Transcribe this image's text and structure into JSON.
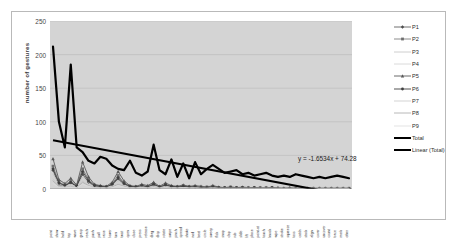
{
  "chart_data": {
    "type": "line",
    "title": "",
    "xlabel": "",
    "ylabel": "number of gestures",
    "ylim": [
      0,
      250
    ],
    "yticks": [
      0,
      50,
      100,
      150,
      200,
      250
    ],
    "grid": true,
    "legend_position": "right",
    "trendline": {
      "name": "Linear (Total)",
      "equation": "y = -1.6534x + 74.28",
      "slope": -1.6534,
      "intercept": 74.28
    },
    "categories": [
      "point",
      "show",
      "hold",
      "tap",
      "wave",
      "grasp",
      "reach",
      "push",
      "pull",
      "raise",
      "lower",
      "turn",
      "twist",
      "open",
      "close",
      "press",
      "release",
      "drag",
      "drop",
      "rotate",
      "swipe",
      "pinch",
      "spread",
      "shake",
      "nod",
      "beat",
      "circle",
      "sweep",
      "flick",
      "snap",
      "clap",
      "rub",
      "slide",
      "lift",
      "place",
      "point-at",
      "touch",
      "knock",
      "wipe",
      "stroke",
      "squeeze",
      "toss",
      "catch",
      "stack",
      "align",
      "cover",
      "uncover",
      "count",
      "trace",
      "mark",
      "other"
    ],
    "series": [
      {
        "name": "P1",
        "color": "#4d4d4d",
        "values": [
          28,
          6,
          5,
          9,
          4,
          22,
          10,
          4,
          3,
          2,
          6,
          15,
          7,
          3,
          2,
          4,
          3,
          6,
          2,
          5,
          3,
          2,
          4,
          2,
          3,
          2,
          2,
          3,
          2,
          1,
          2,
          1,
          2,
          1,
          2,
          1,
          1,
          2,
          1,
          1,
          1,
          1,
          1,
          1,
          1,
          1,
          1,
          1,
          1,
          1,
          1
        ]
      },
      {
        "name": "P2",
        "color": "#6e6e6e",
        "values": [
          34,
          10,
          6,
          12,
          5,
          30,
          14,
          6,
          4,
          3,
          8,
          20,
          9,
          4,
          3,
          5,
          4,
          8,
          3,
          7,
          4,
          3,
          5,
          3,
          4,
          3,
          3,
          4,
          2,
          2,
          3,
          2,
          2,
          2,
          2,
          2,
          2,
          2,
          1,
          1,
          1,
          1,
          1,
          1,
          1,
          1,
          1,
          1,
          1,
          1,
          1
        ]
      },
      {
        "name": "P3",
        "color": "#c2c2c2",
        "values": [
          22,
          8,
          4,
          7,
          3,
          18,
          9,
          3,
          3,
          2,
          5,
          12,
          6,
          3,
          2,
          3,
          2,
          5,
          2,
          4,
          3,
          2,
          3,
          2,
          2,
          2,
          2,
          2,
          1,
          1,
          2,
          1,
          1,
          1,
          1,
          1,
          1,
          1,
          1,
          1,
          1,
          1,
          1,
          1,
          1,
          1,
          1,
          1,
          1,
          1,
          1
        ]
      },
      {
        "name": "P4",
        "color": "#d0d0d0",
        "values": [
          18,
          5,
          3,
          6,
          3,
          14,
          7,
          3,
          2,
          2,
          4,
          10,
          5,
          2,
          2,
          3,
          2,
          4,
          2,
          3,
          2,
          2,
          3,
          2,
          2,
          1,
          1,
          2,
          1,
          1,
          1,
          1,
          1,
          1,
          1,
          1,
          1,
          1,
          1,
          1,
          1,
          1,
          1,
          1,
          1,
          1,
          1,
          1,
          1,
          1,
          1
        ]
      },
      {
        "name": "P5",
        "color": "#5a5a5a",
        "values": [
          45,
          14,
          8,
          16,
          6,
          40,
          18,
          7,
          5,
          4,
          10,
          26,
          12,
          5,
          4,
          7,
          5,
          10,
          4,
          9,
          5,
          4,
          6,
          4,
          5,
          4,
          3,
          5,
          3,
          2,
          3,
          2,
          3,
          2,
          2,
          2,
          2,
          2,
          2,
          1,
          2,
          1,
          1,
          1,
          1,
          1,
          1,
          1,
          1,
          1,
          1
        ]
      },
      {
        "name": "P6",
        "color": "#3f3f3f",
        "values": [
          30,
          9,
          5,
          10,
          4,
          26,
          12,
          5,
          4,
          3,
          7,
          17,
          8,
          4,
          3,
          5,
          3,
          7,
          3,
          6,
          4,
          3,
          4,
          3,
          3,
          2,
          2,
          3,
          2,
          2,
          2,
          2,
          2,
          1,
          2,
          1,
          1,
          2,
          1,
          1,
          1,
          1,
          1,
          1,
          1,
          1,
          1,
          1,
          1,
          1,
          1
        ]
      },
      {
        "name": "P7",
        "color": "#c8c8c8",
        "values": [
          15,
          4,
          3,
          5,
          2,
          12,
          6,
          2,
          2,
          2,
          4,
          9,
          4,
          2,
          2,
          3,
          2,
          4,
          2,
          3,
          2,
          2,
          2,
          2,
          2,
          1,
          1,
          2,
          1,
          1,
          1,
          1,
          1,
          1,
          1,
          1,
          1,
          1,
          1,
          1,
          1,
          1,
          1,
          1,
          1,
          1,
          1,
          1,
          1,
          1,
          1
        ]
      },
      {
        "name": "P8",
        "color": "#b0b0b0",
        "values": [
          12,
          4,
          2,
          4,
          2,
          10,
          5,
          2,
          2,
          1,
          3,
          7,
          4,
          2,
          1,
          2,
          2,
          3,
          1,
          3,
          2,
          1,
          2,
          1,
          2,
          1,
          1,
          1,
          1,
          1,
          1,
          1,
          1,
          1,
          1,
          1,
          1,
          1,
          1,
          1,
          1,
          1,
          1,
          1,
          1,
          1,
          1,
          1,
          1,
          1,
          1
        ]
      },
      {
        "name": "P9",
        "color": "#dcdcdc",
        "values": [
          8,
          3,
          2,
          3,
          2,
          7,
          4,
          2,
          1,
          1,
          2,
          5,
          3,
          1,
          1,
          2,
          1,
          2,
          1,
          2,
          1,
          1,
          2,
          1,
          1,
          1,
          1,
          1,
          1,
          1,
          1,
          1,
          1,
          1,
          1,
          1,
          1,
          1,
          1,
          1,
          1,
          1,
          1,
          1,
          1,
          1,
          1,
          1,
          1,
          1,
          1
        ]
      },
      {
        "name": "Total",
        "color": "#000000",
        "values": [
          212,
          100,
          62,
          185,
          62,
          55,
          42,
          38,
          48,
          45,
          35,
          30,
          28,
          42,
          24,
          20,
          26,
          66,
          28,
          22,
          44,
          18,
          38,
          16,
          40,
          22,
          30,
          36,
          30,
          24,
          26,
          28,
          22,
          24,
          20,
          22,
          24,
          20,
          18,
          20,
          18,
          22,
          20,
          18,
          16,
          18,
          16,
          18,
          20,
          18,
          16
        ]
      }
    ]
  },
  "legend": {
    "items": [
      {
        "label": "P1",
        "color": "#4d4d4d",
        "marker": "diamond",
        "width": 0.8
      },
      {
        "label": "P2",
        "color": "#6e6e6e",
        "marker": "square",
        "width": 0.8
      },
      {
        "label": "P3",
        "color": "#c2c2c2",
        "marker": "none",
        "width": 0.8
      },
      {
        "label": "P4",
        "color": "#d0d0d0",
        "marker": "none",
        "width": 0.8
      },
      {
        "label": "P5",
        "color": "#5a5a5a",
        "marker": "triangle",
        "width": 0.9
      },
      {
        "label": "P6",
        "color": "#3f3f3f",
        "marker": "dot",
        "width": 0.9
      },
      {
        "label": "P7",
        "color": "#c8c8c8",
        "marker": "none",
        "width": 0.8
      },
      {
        "label": "P8",
        "color": "#b0b0b0",
        "marker": "none",
        "width": 0.9
      },
      {
        "label": "P9",
        "color": "#dcdcdc",
        "marker": "none",
        "width": 0.8
      },
      {
        "label": "Total",
        "color": "#000000",
        "marker": "none",
        "width": 2.2
      },
      {
        "label": "Linear (Total)",
        "color": "#000000",
        "marker": "none",
        "width": 2.2
      }
    ]
  },
  "colors": {
    "plot_background": "#d4d4d4",
    "figure_background": "#ffffff",
    "frame_border": "#b9b9b9",
    "gridline": "#bdbdbd",
    "axis": "#808080",
    "total_series": "#000000",
    "trendline": "#000000"
  }
}
